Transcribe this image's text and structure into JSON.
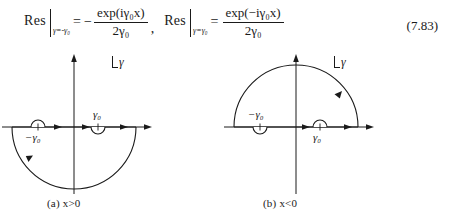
{
  "equation": {
    "left": {
      "res_label": "Res",
      "subscript": "γ=-γ₀",
      "relation": "=",
      "sign": "−",
      "numerator": "exp(iγ₀x)",
      "denominator": "2γ₀"
    },
    "separator": ",",
    "right": {
      "res_label": "Res",
      "subscript": "γ=γ₀",
      "relation": "=",
      "sign": "",
      "numerator": "exp(−iγ₀x)",
      "denominator": "2γ₀"
    },
    "number": "(7.83)"
  },
  "figures": [
    {
      "id": "a",
      "caption": "(a) x>0",
      "plane_label": "γ",
      "pole_left_label": "−γ₀",
      "pole_right_label": "γ₀",
      "contour": "lower semicircle",
      "indent_left": "up",
      "indent_right": "down"
    },
    {
      "id": "b",
      "caption": "(b) x<0",
      "plane_label": "γ",
      "pole_left_label": "−γ₀",
      "pole_right_label": "γ₀",
      "contour": "upper semicircle",
      "indent_left": "down",
      "indent_right": "up"
    }
  ],
  "colors": {
    "ink": "#1a1a1a",
    "paper": "#ffffff"
  }
}
